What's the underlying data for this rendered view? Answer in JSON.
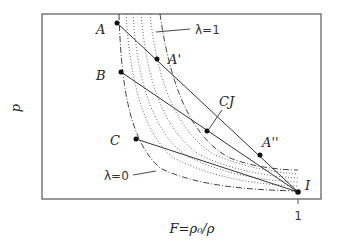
{
  "diagram": {
    "type": "p-F state diagram (Rayleigh lines and Hugoniot curves)",
    "axes": {
      "ylabel": "p",
      "xlabel": "F=ρ₀/ρ",
      "x_tick": "1"
    },
    "points": [
      {
        "id": "A",
        "label": "A"
      },
      {
        "id": "A1",
        "label": "A'"
      },
      {
        "id": "B",
        "label": "B"
      },
      {
        "id": "CJ",
        "label": "CJ"
      },
      {
        "id": "A2",
        "label": "A''"
      },
      {
        "id": "C",
        "label": "C"
      },
      {
        "id": "I",
        "label": "I"
      }
    ],
    "curves": {
      "lambda1": "λ=1",
      "lambda0": "λ=0"
    },
    "colors": {
      "line": "#333333",
      "frame": "#555555"
    }
  }
}
